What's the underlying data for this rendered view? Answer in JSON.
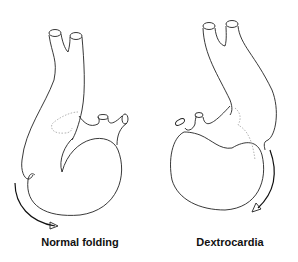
{
  "figure": {
    "panels": [
      {
        "id": "normal",
        "label": "Normal folding",
        "rotation_arrow": "counterclockwise-bottom-left"
      },
      {
        "id": "dextro",
        "label": "Dextrocardia",
        "rotation_arrow": "clockwise-bottom-right"
      }
    ]
  }
}
